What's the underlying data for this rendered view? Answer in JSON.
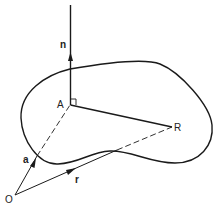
{
  "diagram": {
    "labels": {
      "normal": "n",
      "point_a": "A",
      "point_r": "R",
      "origin": "O",
      "vector_a": "a",
      "vector_r": "r"
    },
    "colors": {
      "stroke": "#1a1a1a",
      "background": "#ffffff"
    }
  }
}
